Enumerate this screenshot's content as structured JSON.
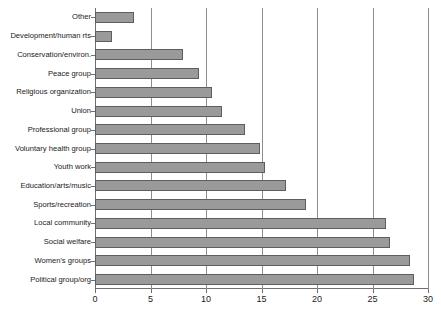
{
  "chart_data": {
    "type": "bar",
    "orientation": "horizontal",
    "title": "",
    "xlabel": "",
    "ylabel": "",
    "xlim": [
      0,
      30
    ],
    "xticks": [
      0,
      5,
      10,
      15,
      20,
      25,
      30
    ],
    "grid": true,
    "grid_axis": "x",
    "legend": false,
    "bar_color": "#9a9a9a",
    "bar_edge_color": "#5e5e5e",
    "categories": [
      "Other",
      "Development/human rts",
      "Conservation/environ.",
      "Peace group",
      "Religious organization",
      "Union",
      "Professional group",
      "Voluntary health group",
      "Youth work",
      "Education/arts/music",
      "Sports/recreation",
      "Local community",
      "Social welfare",
      "Women's groups",
      "Political group/org"
    ],
    "values": [
      3.5,
      1.5,
      7.9,
      9.4,
      10.5,
      11.4,
      13.5,
      14.9,
      15.3,
      17.2,
      19.0,
      26.2,
      26.6,
      28.4,
      28.7
    ]
  }
}
